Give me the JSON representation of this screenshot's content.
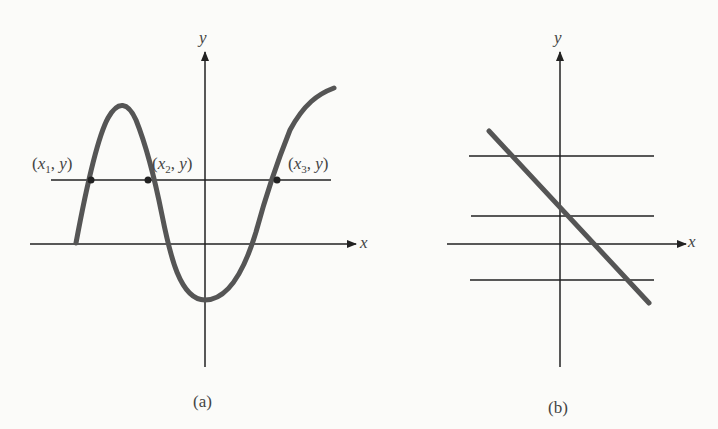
{
  "panels": [
    {
      "id": "a",
      "caption": "(a)",
      "x_axis_label": "",
      "y_axis_label": "y",
      "points": [
        {
          "label_x": "x",
          "label_sub": "1",
          "label_y": "y"
        },
        {
          "label_x": "x",
          "label_sub": "2",
          "label_y": "y"
        },
        {
          "label_x": "x",
          "label_sub": "3",
          "label_y": "y"
        }
      ],
      "description": "Curve crossing a horizontal line at three points (x1,y),(x2,y),(x3,y)"
    },
    {
      "id": "b",
      "caption": "(b)",
      "x_axis_label": "x",
      "y_axis_label": "y",
      "description": "Decreasing straight line intersecting each horizontal line exactly once"
    }
  ],
  "a_x_label": "x",
  "colors": {
    "curve": "#555555",
    "axis": "#222222",
    "background": "#fbfbf9"
  }
}
